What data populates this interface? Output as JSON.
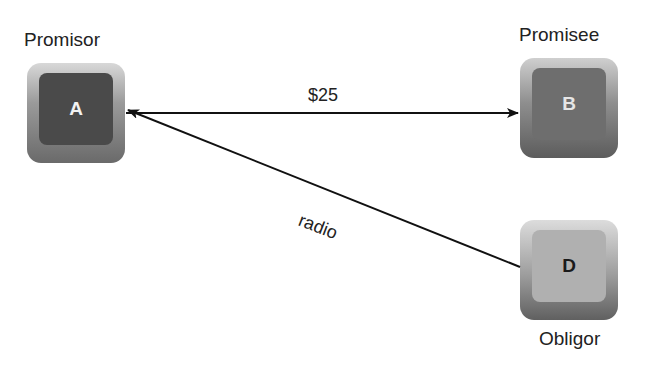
{
  "nodes": [
    {
      "id": "A",
      "letter": "A",
      "role": "Promisor"
    },
    {
      "id": "B",
      "letter": "B",
      "role": "Promisee"
    },
    {
      "id": "D",
      "letter": "D",
      "role": "Obligor"
    }
  ],
  "edges": [
    {
      "from": "A",
      "to": "B",
      "label": "$25"
    },
    {
      "from": "D",
      "to": "A",
      "label": "radio"
    }
  ],
  "colors": {
    "line": "#111111"
  }
}
